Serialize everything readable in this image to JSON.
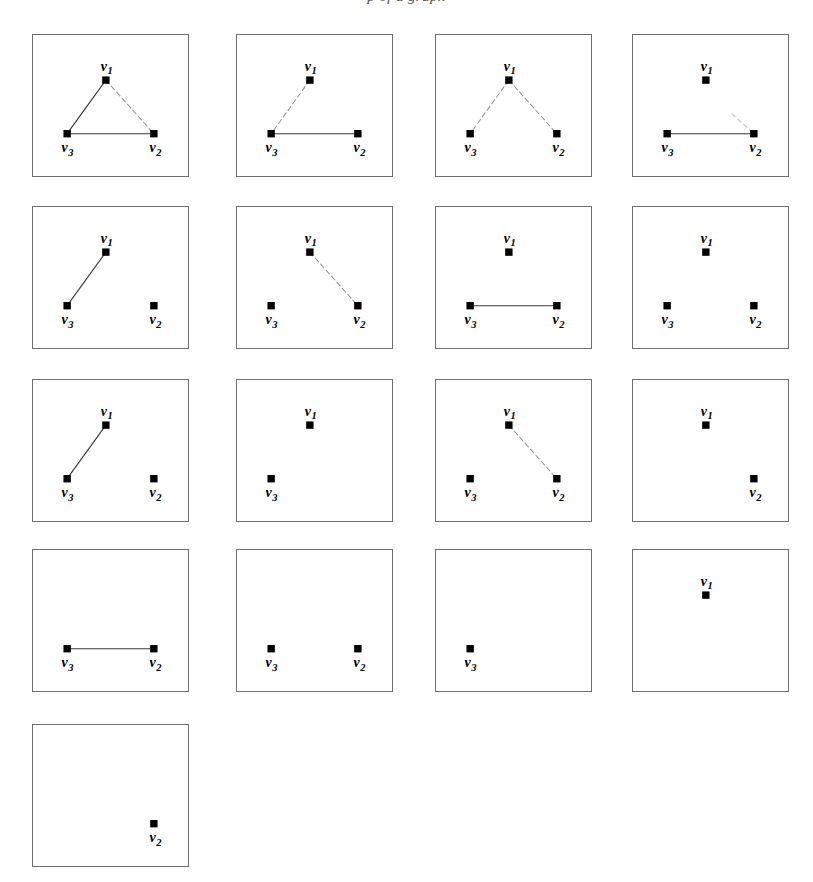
{
  "figure": {
    "top_text": "p of a graph",
    "vertex_labels": {
      "v1": "v",
      "v1_sub": "1",
      "v2": "v",
      "v2_sub": "2",
      "v3": "v",
      "v3_sub": "3"
    },
    "colors": {
      "panel_border": "#6f6f6f",
      "vertex_fill": "#000000",
      "edge_solid": "#3a3a3a",
      "edge_faint": "#8d8d8d",
      "background": "#ffffff"
    },
    "grid": {
      "rows": 5,
      "cols": 4,
      "panel_count": 17
    }
  },
  "chart_data": {
    "type": "diagram",
    "node_labels": [
      "v1",
      "v2",
      "v3"
    ],
    "node_positions": {
      "v1": [
        0.47,
        0.32
      ],
      "v2": [
        0.78,
        0.7
      ],
      "v3": [
        0.22,
        0.7
      ]
    },
    "edge_styles": {
      "solid": "#3a3a3a",
      "dashed": "#8d8d8d"
    },
    "panels": [
      {
        "id": 1,
        "row": 1,
        "col": 1,
        "vertices": [
          "v1",
          "v2",
          "v3"
        ],
        "edges": [
          {
            "from": "v1",
            "to": "v3",
            "style": "solid"
          },
          {
            "from": "v1",
            "to": "v2",
            "style": "dashed"
          },
          {
            "from": "v3",
            "to": "v2",
            "style": "solid"
          }
        ]
      },
      {
        "id": 2,
        "row": 1,
        "col": 2,
        "vertices": [
          "v1",
          "v2",
          "v3"
        ],
        "edges": [
          {
            "from": "v1",
            "to": "v3",
            "style": "dashed"
          },
          {
            "from": "v3",
            "to": "v2",
            "style": "solid"
          }
        ]
      },
      {
        "id": 3,
        "row": 1,
        "col": 3,
        "vertices": [
          "v1",
          "v2",
          "v3"
        ],
        "edges": [
          {
            "from": "v1",
            "to": "v3",
            "style": "dashed"
          },
          {
            "from": "v1",
            "to": "v2",
            "style": "dashed"
          }
        ]
      },
      {
        "id": 4,
        "row": 1,
        "col": 4,
        "vertices": [
          "v1",
          "v2",
          "v3"
        ],
        "edges": [
          {
            "from": "v3",
            "to": "v2",
            "style": "solid"
          },
          {
            "from": "v2",
            "to": "stub",
            "style": "stub"
          }
        ]
      },
      {
        "id": 5,
        "row": 2,
        "col": 1,
        "vertices": [
          "v1",
          "v2",
          "v3"
        ],
        "edges": [
          {
            "from": "v1",
            "to": "v3",
            "style": "solid"
          }
        ]
      },
      {
        "id": 6,
        "row": 2,
        "col": 2,
        "vertices": [
          "v1",
          "v2",
          "v3"
        ],
        "edges": [
          {
            "from": "v1",
            "to": "v2",
            "style": "dashed"
          }
        ]
      },
      {
        "id": 7,
        "row": 2,
        "col": 3,
        "vertices": [
          "v1",
          "v2",
          "v3"
        ],
        "edges": [
          {
            "from": "v3",
            "to": "v2",
            "style": "solid"
          }
        ]
      },
      {
        "id": 8,
        "row": 2,
        "col": 4,
        "vertices": [
          "v1",
          "v2",
          "v3"
        ],
        "edges": []
      },
      {
        "id": 9,
        "row": 3,
        "col": 1,
        "vertices": [
          "v1",
          "v2",
          "v3"
        ],
        "edges": [
          {
            "from": "v1",
            "to": "v3",
            "style": "solid"
          }
        ]
      },
      {
        "id": 10,
        "row": 3,
        "col": 2,
        "vertices": [
          "v1",
          "v3"
        ],
        "edges": []
      },
      {
        "id": 11,
        "row": 3,
        "col": 3,
        "vertices": [
          "v1",
          "v2",
          "v3"
        ],
        "edges": [
          {
            "from": "v1",
            "to": "v2",
            "style": "dashed"
          }
        ]
      },
      {
        "id": 12,
        "row": 3,
        "col": 4,
        "vertices": [
          "v1",
          "v2"
        ],
        "edges": []
      },
      {
        "id": 13,
        "row": 4,
        "col": 1,
        "vertices": [
          "v2",
          "v3"
        ],
        "edges": [
          {
            "from": "v3",
            "to": "v2",
            "style": "solid"
          }
        ]
      },
      {
        "id": 14,
        "row": 4,
        "col": 2,
        "vertices": [
          "v2",
          "v3"
        ],
        "edges": []
      },
      {
        "id": 15,
        "row": 4,
        "col": 3,
        "vertices": [
          "v3"
        ],
        "edges": []
      },
      {
        "id": 16,
        "row": 4,
        "col": 4,
        "vertices": [
          "v1"
        ],
        "edges": []
      },
      {
        "id": 17,
        "row": 5,
        "col": 1,
        "vertices": [
          "v2"
        ],
        "edges": []
      }
    ]
  }
}
